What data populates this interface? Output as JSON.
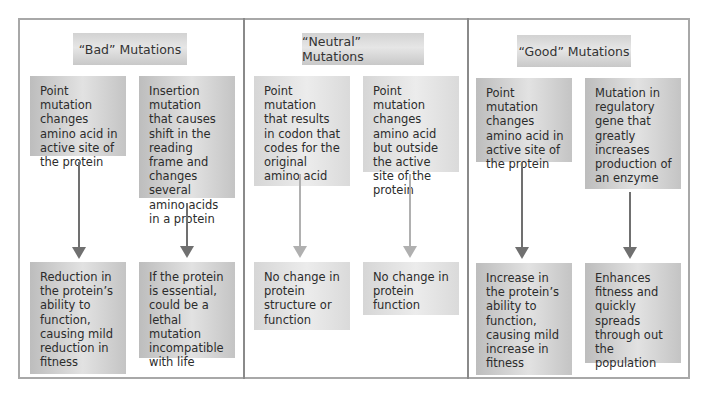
{
  "diagram": {
    "type": "flow",
    "sections": [
      {
        "title": "“Bad” Mutations",
        "columns": [
          {
            "cause": "Point mutation changes amino acid in active site of the protein",
            "effect": "Reduction in the protein’s ability to function, causing mild reduction in fitness"
          },
          {
            "cause": "Insertion mutation that causes shift in the reading frame and changes several amino acids in a protein",
            "effect": "If the protein is essential, could be a lethal mutation incompatible with life"
          }
        ]
      },
      {
        "title": "“Neutral” Mutations",
        "columns": [
          {
            "cause": "Point mutation that results in codon that codes for the original amino acid",
            "effect": "No change in protein structure or function"
          },
          {
            "cause": "Point mutation changes amino acid but outside the active site of the protein",
            "effect": "No change in protein function"
          }
        ]
      },
      {
        "title": "“Good” Mutations",
        "columns": [
          {
            "cause": "Point mutation changes amino acid in active site of the protein",
            "effect": "Increase in the protein’s ability to function, causing mild increase in fitness"
          },
          {
            "cause": "Mutation in regulatory gene that greatly increases production of an enzyme",
            "effect": "Enhances fitness and quickly spreads through out the population"
          }
        ]
      }
    ],
    "colors": {
      "frame_border": "#a8a8a8",
      "divider": "#8a8a8a",
      "box_dark": "#c4c4c4",
      "box_light": "#dcdcdc",
      "arrow_dark": "#707070",
      "arrow_light": "#b0b0b0"
    }
  }
}
